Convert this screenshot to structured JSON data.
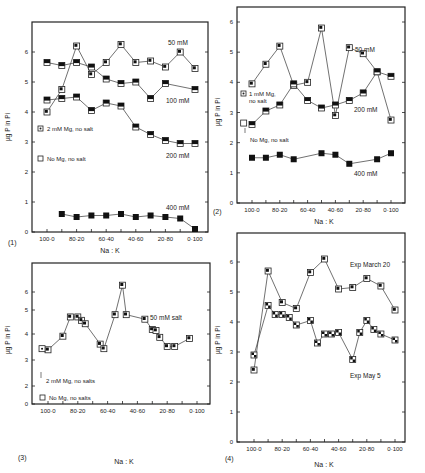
{
  "figure": {
    "xlabel": "Na : K",
    "ylabel": "µg P in Pi",
    "xtick_labels": [
      "100·0",
      "80·20",
      "60·40",
      "40·60",
      "20·80",
      "0·100"
    ]
  },
  "chart_data": [
    {
      "type": "line",
      "panel_label": "(1)",
      "xlabel": "Na : K",
      "ylabel": "µg P in Pi",
      "ylim": [
        0,
        6.5
      ],
      "yticks": [
        0,
        1,
        2,
        3,
        4,
        5,
        6
      ],
      "xtick_labels": [
        "100·0",
        "80·20",
        "60·40",
        "40·60",
        "20·80",
        "0·100"
      ],
      "x": [
        100,
        90,
        80,
        70,
        60,
        50,
        40,
        30,
        20,
        10,
        0
      ],
      "series": [
        {
          "name": "50 mM",
          "marker": "open-dot",
          "x": [
            100,
            90,
            80,
            70,
            60,
            50,
            40,
            30,
            20,
            10,
            0
          ],
          "values": [
            4.0,
            4.75,
            6.2,
            5.25,
            5.65,
            6.25,
            5.65,
            5.7,
            5.5,
            6.0,
            5.45
          ]
        },
        {
          "name": "100 mM",
          "marker": "half",
          "x": [
            100,
            90,
            80,
            70,
            60,
            50,
            40,
            30,
            20,
            10,
            0
          ],
          "values": [
            5.65,
            5.55,
            5.65,
            5.5,
            5.1,
            4.95,
            5.0,
            4.45,
            4.95,
            null,
            4.75
          ]
        },
        {
          "name": "200 mM",
          "marker": "half",
          "x": [
            100,
            90,
            80,
            70,
            60,
            50,
            40,
            30,
            20,
            10,
            0
          ],
          "values": [
            4.4,
            4.45,
            4.5,
            4.05,
            4.3,
            4.2,
            3.5,
            3.25,
            3.05,
            2.95,
            2.95
          ]
        },
        {
          "name": "400 mM",
          "marker": "filled",
          "x": [
            90,
            80,
            70,
            60,
            50,
            40,
            30,
            20,
            10,
            0
          ],
          "values": [
            0.6,
            0.5,
            0.55,
            0.55,
            0.6,
            0.5,
            0.55,
            0.5,
            0.45,
            0.1
          ]
        }
      ],
      "annotations": [
        "50 mM",
        "100 mM",
        "200 mM",
        "400 mM",
        "2 mM Mg, no salt",
        "No Mg, no salt"
      ]
    },
    {
      "type": "line",
      "panel_label": "(2)",
      "xlabel": "Na : K",
      "ylabel": "µg P in Pi",
      "ylim": [
        0,
        6.5
      ],
      "yticks": [
        0,
        1,
        2,
        3,
        4,
        5,
        6
      ],
      "xtick_labels": [
        "100·0",
        "80·20",
        "60·40",
        "40·60",
        "20·80",
        "0·100"
      ],
      "series": [
        {
          "name": "50 mM",
          "marker": "open-dot",
          "x": [
            100,
            90,
            80,
            70,
            60,
            50,
            40,
            30,
            20,
            10,
            0
          ],
          "values": [
            3.95,
            4.6,
            5.2,
            3.9,
            4.0,
            5.8,
            2.9,
            5.15,
            4.95,
            4.35,
            2.75
          ]
        },
        {
          "name": "200 mM",
          "marker": "half",
          "x": [
            100,
            90,
            80,
            70,
            60,
            50,
            40,
            30,
            20,
            10,
            0
          ],
          "values": [
            2.6,
            3.05,
            3.25,
            3.95,
            3.4,
            3.15,
            3.25,
            3.4,
            3.65,
            4.35,
            4.2
          ]
        },
        {
          "name": "400 mM",
          "marker": "filled",
          "x": [
            100,
            90,
            80,
            70,
            50,
            40,
            30,
            10,
            0
          ],
          "values": [
            1.5,
            1.5,
            1.6,
            1.45,
            1.65,
            1.6,
            1.3,
            1.45,
            1.65
          ]
        },
        {
          "name": "No Mg, no salt",
          "marker": "open",
          "x": [
            106
          ],
          "values": [
            2.65
          ]
        },
        {
          "name": "1 mM Mg, no salt",
          "marker": "dotted",
          "x": [],
          "values": []
        }
      ],
      "annotations": [
        "50 mM",
        "200 mM",
        "400 mM",
        "1 mM Mg, no salt",
        "No Mg, no salt"
      ]
    },
    {
      "type": "line",
      "panel_label": "(3)",
      "xlabel": "Na : K",
      "ylabel": "µg P in Pi",
      "ylim": [
        0,
        7
      ],
      "yticks": [
        0,
        2,
        3,
        4,
        5,
        6
      ],
      "xtick_labels": [
        "100·0",
        "80·20",
        "60·40",
        "40·60",
        "20·80",
        "0·100"
      ],
      "series": [
        {
          "name": "50 mM salt",
          "marker": "open-dot",
          "x": [
            100,
            90,
            85,
            80,
            77.5,
            75,
            65,
            62.5,
            55,
            50,
            47.5,
            35,
            30,
            27.5,
            25,
            20,
            15,
            5
          ],
          "values": [
            3.45,
            4.05,
            4.9,
            4.9,
            4.75,
            4.6,
            3.7,
            3.5,
            5.0,
            6.3,
            5.0,
            4.8,
            4.35,
            4.3,
            4.0,
            3.6,
            3.6,
            3.95
          ]
        },
        {
          "name": "2 mM Mg, no salts",
          "marker": "dotted",
          "x": [
            104
          ],
          "values": [
            3.5
          ]
        }
      ],
      "annotations": [
        "50 mM salt",
        "2 mM Mg, no salts",
        "No Mg, no salts"
      ]
    },
    {
      "type": "line",
      "panel_label": "(4)",
      "xlabel": "Na : K",
      "ylabel": "µg P in Pi",
      "ylim": [
        0,
        6.5
      ],
      "yticks": [
        0,
        1,
        2,
        3,
        4,
        5,
        6
      ],
      "xtick_labels": [
        "100·0",
        "80·20",
        "60·40",
        "40·60",
        "20·80",
        "0·100"
      ],
      "series": [
        {
          "name": "Exp March 20",
          "marker": "open-dot",
          "x": [
            100,
            90,
            80,
            70,
            60,
            50,
            40,
            30,
            20,
            10,
            0
          ],
          "values": [
            2.4,
            5.7,
            4.65,
            4.45,
            5.65,
            6.1,
            5.1,
            5.15,
            5.45,
            5.2,
            4.4
          ]
        },
        {
          "name": "Exp May 5",
          "marker": "checker",
          "x": [
            100,
            90,
            85,
            80,
            75,
            70,
            60,
            55,
            50,
            45,
            40,
            30,
            25,
            20,
            15,
            10,
            0
          ],
          "values": [
            2.9,
            4.55,
            4.25,
            4.25,
            4.15,
            3.9,
            4.05,
            3.3,
            3.6,
            3.6,
            3.65,
            2.75,
            3.65,
            4.05,
            3.75,
            3.6,
            3.4
          ]
        }
      ],
      "annotations": [
        "Exp March 20",
        "Exp May 5"
      ]
    }
  ],
  "panels": [
    {
      "label": "(1)",
      "notes": [
        "50 mM",
        "100 mM",
        "200 mM",
        "400 mM"
      ],
      "legend": [
        "2 mM Mg, no salt",
        "No Mg, no salt"
      ]
    },
    {
      "label": "(2)",
      "notes": [
        "50 mM",
        "200 mM",
        "400 mM"
      ],
      "legend": [
        "1 mM Mg,",
        "no salt",
        "No Mg, no salt"
      ]
    },
    {
      "label": "(3)",
      "notes": [
        "50 mM salt"
      ],
      "legend": [
        "2 mM Mg, no salts",
        "No Mg, no salts"
      ]
    },
    {
      "label": "(4)",
      "notes": [
        "Exp March 20",
        "Exp May 5"
      ],
      "legend": []
    }
  ]
}
